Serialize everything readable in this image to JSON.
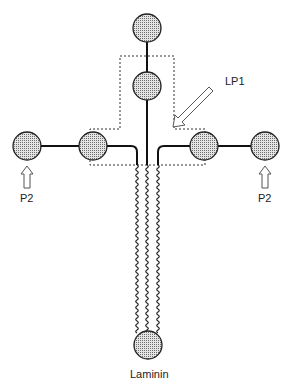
{
  "diagram": {
    "labels": {
      "lp1": "LP1",
      "p2_left": "P2",
      "p2_right": "P2",
      "laminin": "Laminin"
    },
    "nodes": [
      {
        "id": "top",
        "cx": 147,
        "cy": 28
      },
      {
        "id": "upper",
        "cx": 147,
        "cy": 86
      },
      {
        "id": "left-outer",
        "cx": 27,
        "cy": 146
      },
      {
        "id": "left-inner",
        "cx": 93,
        "cy": 146
      },
      {
        "id": "right-inner",
        "cx": 204,
        "cy": 146
      },
      {
        "id": "right-outer",
        "cx": 265,
        "cy": 146
      },
      {
        "id": "laminin",
        "cx": 148,
        "cy": 345
      }
    ],
    "colors": {
      "line": "#111111",
      "circle_fill": "#c8c8c8",
      "dashed": "#333333"
    }
  }
}
